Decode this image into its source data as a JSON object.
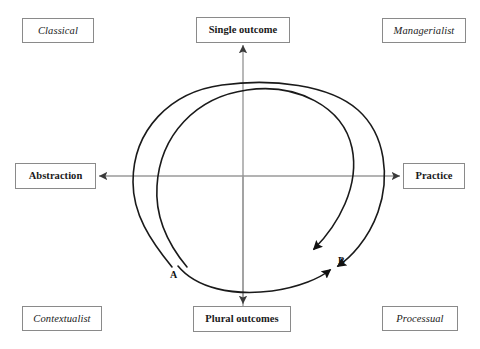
{
  "diagram": {
    "colors": {
      "axis": "#9a9a9a",
      "curve": "#1a1a1a",
      "box_border": "#8a8a8a",
      "text": "#1a1a1a",
      "background": "#ffffff"
    },
    "corners": {
      "top_left": "Classical",
      "top_right": "Managerialist",
      "bottom_left": "Contextualist",
      "bottom_right": "Processual"
    },
    "axes": {
      "top": "Single outcome",
      "bottom": "Plural outcomes",
      "left": "Abstraction",
      "right": "Practice",
      "vertical_name": "outcome-axis",
      "horizontal_name": "abstraction-practice-axis"
    },
    "curves": [
      {
        "id": "A",
        "label": "A",
        "name": "outer-spiral-curve",
        "start": "lower-left",
        "end": "lower-right",
        "arrowhead": true
      },
      {
        "id": "B",
        "label": "B",
        "name": "inner-spiral-curve",
        "start": "lower-left",
        "end": "lower-right",
        "arrowhead": true
      }
    ]
  }
}
